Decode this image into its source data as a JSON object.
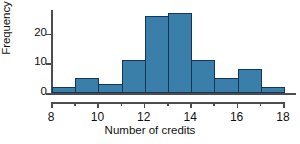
{
  "chart_data": {
    "type": "bar",
    "title": "",
    "xlabel": "Number of credits",
    "ylabel": "Frequency",
    "bin_edges": [
      8,
      9,
      10,
      11,
      12,
      13,
      14,
      15,
      16,
      17,
      18
    ],
    "categories": [
      "8-9",
      "9-10",
      "10-11",
      "11-12",
      "12-13",
      "13-14",
      "14-15",
      "15-16",
      "16-17",
      "17-18"
    ],
    "values": [
      2,
      5,
      3,
      11,
      26,
      27,
      11,
      5,
      8,
      2
    ],
    "xlim": [
      8,
      18
    ],
    "ylim": [
      0,
      28
    ],
    "x_ticks": [
      8,
      9,
      10,
      11,
      12,
      13,
      14,
      15,
      16,
      17,
      18
    ],
    "x_tick_labels": [
      "8",
      "",
      "10",
      "",
      "12",
      "",
      "14",
      "",
      "16",
      "",
      "18"
    ],
    "y_ticks": [
      0,
      10,
      20
    ],
    "y_tick_labels": [
      "0",
      "10",
      "20"
    ],
    "grid": false,
    "legend": null,
    "bar_fill_color": "#3a7faa",
    "bar_edge_color": "#14365c",
    "axis_color": "#4d4d4d",
    "background_color": "#ffffff"
  }
}
